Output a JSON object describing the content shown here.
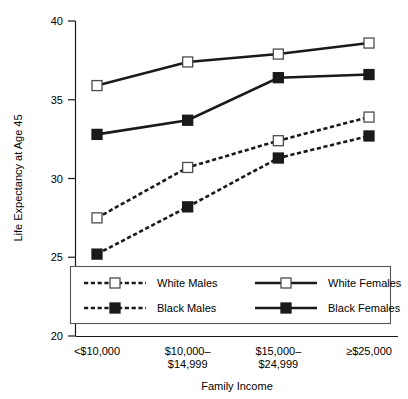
{
  "chart_data": {
    "type": "line",
    "title": "",
    "xlabel": "Family Income",
    "ylabel": "Life Expectancy at Age 45",
    "categories": [
      "<$10,000",
      "$10,000–\n$14,999",
      "$15,000–\n$24,999",
      "≥$25,000"
    ],
    "category_lines": [
      [
        "<$10,000"
      ],
      [
        "$10,000–",
        "$14,999"
      ],
      [
        "$15,000–",
        "$24,999"
      ],
      [
        "≥$25,000"
      ]
    ],
    "ylim": [
      20,
      40
    ],
    "yticks": [
      20,
      25,
      30,
      35,
      40
    ],
    "ytick_labels": [
      "20",
      "25",
      "30",
      "35",
      "40"
    ],
    "grid": false,
    "legend_position": "inside-bottom-center",
    "series": [
      {
        "name": "White Males",
        "values": [
          27.5,
          30.7,
          32.4,
          33.9
        ],
        "line_style": "dashed",
        "marker": "open-square"
      },
      {
        "name": "Black Males",
        "values": [
          25.2,
          28.2,
          31.3,
          32.7
        ],
        "line_style": "dashed",
        "marker": "filled-square"
      },
      {
        "name": "White Females",
        "values": [
          35.9,
          37.4,
          37.9,
          38.6
        ],
        "line_style": "solid",
        "marker": "open-square"
      },
      {
        "name": "Black Females",
        "values": [
          32.8,
          33.7,
          36.4,
          36.6
        ],
        "line_style": "solid",
        "marker": "filled-square"
      }
    ],
    "legend_entries": [
      {
        "label": "White Males",
        "line_style": "dashed",
        "marker": "open-square"
      },
      {
        "label": "White Females",
        "line_style": "solid",
        "marker": "open-square"
      },
      {
        "label": "Black Males",
        "line_style": "dashed",
        "marker": "filled-square"
      },
      {
        "label": "Black Females",
        "line_style": "solid",
        "marker": "filled-square"
      }
    ],
    "colors": {
      "line": "#1a1a1a",
      "marker_fill_open": "#ffffff",
      "marker_fill_closed": "#1a1a1a",
      "axis": "#1a1a1a",
      "background": "#ffffff"
    }
  }
}
